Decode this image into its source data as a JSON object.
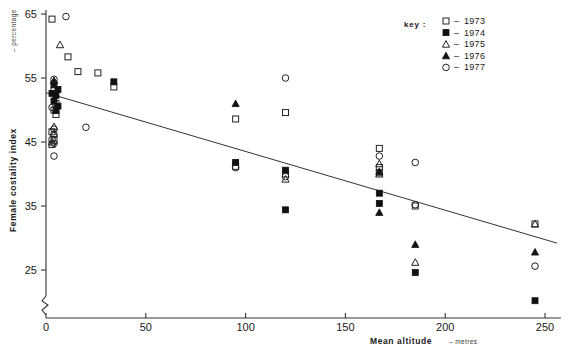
{
  "chart_data": {
    "type": "scatter",
    "title": "",
    "xlabel": "Mean altitude",
    "xlabel_unit": "metres",
    "ylabel": "Female costality index",
    "ylabel_unit": "percentage",
    "xlim": [
      0,
      258
    ],
    "ylim": [
      18,
      66
    ],
    "xticks": [
      0,
      50,
      100,
      150,
      200,
      250
    ],
    "yticks": [
      25,
      35,
      45,
      55,
      65
    ],
    "grid": false,
    "axis_break_y": true,
    "legend_position": "top-right",
    "legend_title": "key :",
    "series": [
      {
        "name": "1973",
        "marker": "open-square",
        "points": [
          [
            3,
            64.2
          ],
          [
            11,
            58.3
          ],
          [
            16,
            56.0
          ],
          [
            26,
            55.8
          ],
          [
            4,
            53.0
          ],
          [
            5,
            51.0
          ],
          [
            4,
            50.0
          ],
          [
            5,
            49.3
          ],
          [
            3,
            46.6
          ],
          [
            4,
            45.2
          ],
          [
            3,
            44.6
          ],
          [
            34,
            53.6
          ],
          [
            95,
            48.6
          ],
          [
            120,
            49.6
          ],
          [
            95,
            41.2
          ],
          [
            120,
            40.0
          ],
          [
            167,
            44.0
          ],
          [
            167,
            41.0
          ],
          [
            167,
            40.2
          ],
          [
            185,
            35.0
          ],
          [
            245,
            32.2
          ]
        ]
      },
      {
        "name": "1974",
        "marker": "filled-square",
        "points": [
          [
            4,
            54.0
          ],
          [
            6,
            53.2
          ],
          [
            3,
            52.6
          ],
          [
            5,
            52.3
          ],
          [
            4,
            51.4
          ],
          [
            6,
            50.6
          ],
          [
            5,
            49.9
          ],
          [
            34,
            54.4
          ],
          [
            95,
            41.8
          ],
          [
            120,
            40.6
          ],
          [
            120,
            34.4
          ],
          [
            167,
            37.0
          ],
          [
            167,
            35.4
          ],
          [
            185,
            24.6
          ],
          [
            245,
            20.2
          ]
        ]
      },
      {
        "name": "1975",
        "marker": "open-triangle",
        "points": [
          [
            7,
            60.2
          ],
          [
            4,
            47.4
          ],
          [
            4,
            46.3
          ],
          [
            3,
            45.0
          ],
          [
            120,
            39.2
          ],
          [
            167,
            41.6
          ],
          [
            167,
            40.0
          ],
          [
            185,
            26.2
          ],
          [
            245,
            32.2
          ]
        ]
      },
      {
        "name": "1976",
        "marker": "filled-triangle",
        "points": [
          [
            4,
            54.6
          ],
          [
            95,
            51.0
          ],
          [
            167,
            40.4
          ],
          [
            167,
            34.0
          ],
          [
            185,
            29.0
          ],
          [
            245,
            27.8
          ]
        ]
      },
      {
        "name": "1977",
        "marker": "open-circle",
        "points": [
          [
            10,
            64.6
          ],
          [
            4,
            54.8
          ],
          [
            4,
            54.2
          ],
          [
            3,
            50.4
          ],
          [
            4,
            47.0
          ],
          [
            4,
            46.2
          ],
          [
            3,
            45.4
          ],
          [
            4,
            44.8
          ],
          [
            4,
            42.8
          ],
          [
            20,
            47.3
          ],
          [
            95,
            41.0
          ],
          [
            120,
            55.0
          ],
          [
            120,
            39.6
          ],
          [
            167,
            42.8
          ],
          [
            185,
            41.8
          ],
          [
            185,
            35.2
          ],
          [
            245,
            25.6
          ]
        ]
      }
    ],
    "trendline": {
      "x_start": 0,
      "y_start": 52.7,
      "x_end": 256,
      "y_end": 29.2
    }
  }
}
